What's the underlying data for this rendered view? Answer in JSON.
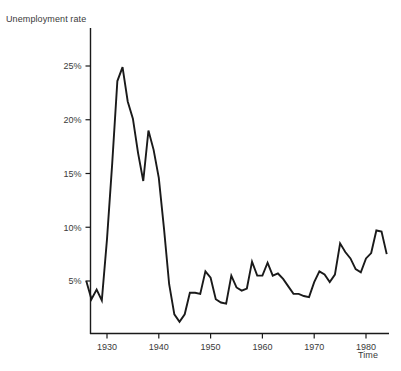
{
  "chart_data": {
    "type": "line",
    "title": "",
    "xlabel": "Time",
    "ylabel": "Unemployment rate",
    "xlim": [
      1926,
      1984
    ],
    "ylim": [
      0,
      27
    ],
    "grid": false,
    "legend": null,
    "x_ticks": [
      1930,
      1940,
      1950,
      1960,
      1970,
      1980
    ],
    "x_tick_labels": [
      "1930",
      "1940",
      "1950",
      "1960",
      "1970",
      "1980"
    ],
    "y_ticks": [
      5,
      10,
      15,
      20,
      25
    ],
    "y_tick_labels": [
      "5%",
      "10%",
      "15%",
      "20%",
      "25%"
    ],
    "series": [
      {
        "name": "Unemployment rate",
        "color": "#1a1a1a",
        "x": [
          1926,
          1927,
          1928,
          1929,
          1930,
          1931,
          1932,
          1933,
          1934,
          1935,
          1936,
          1937,
          1938,
          1939,
          1940,
          1941,
          1942,
          1943,
          1944,
          1945,
          1946,
          1947,
          1948,
          1949,
          1950,
          1951,
          1952,
          1953,
          1954,
          1955,
          1956,
          1957,
          1958,
          1959,
          1960,
          1961,
          1962,
          1963,
          1964,
          1965,
          1966,
          1967,
          1968,
          1969,
          1970,
          1971,
          1972,
          1973,
          1974,
          1975,
          1976,
          1977,
          1978,
          1979,
          1980,
          1981,
          1982,
          1983,
          1984
        ],
        "values": [
          5.0,
          3.3,
          4.2,
          3.2,
          8.9,
          15.9,
          23.6,
          24.9,
          21.7,
          20.1,
          16.9,
          14.3,
          19.0,
          17.2,
          14.6,
          9.9,
          4.7,
          1.9,
          1.2,
          1.9,
          3.9,
          3.9,
          3.8,
          5.9,
          5.3,
          3.3,
          3.0,
          2.9,
          5.5,
          4.4,
          4.1,
          4.3,
          6.8,
          5.5,
          5.5,
          6.7,
          5.5,
          5.7,
          5.2,
          4.5,
          3.8,
          3.8,
          3.6,
          3.5,
          4.9,
          5.9,
          5.6,
          4.9,
          5.6,
          8.5,
          7.7,
          7.1,
          6.1,
          5.8,
          7.1,
          7.6,
          9.7,
          9.6,
          7.5
        ]
      }
    ]
  },
  "axes": {
    "y_title": "Unemployment rate",
    "x_title": "Time"
  }
}
